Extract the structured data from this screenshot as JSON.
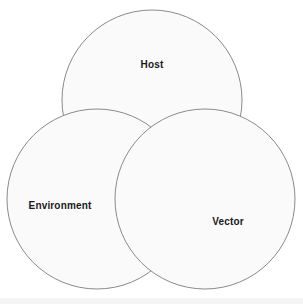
{
  "figure": {
    "type": "venn-diagram",
    "title": "",
    "width": 303,
    "height": 304,
    "background_color": "#ffffff",
    "circle_fill_color": "#fafafa",
    "circle_stroke_color": "#8a8a8a",
    "circle_stroke_width": 1,
    "label_color": "#1a1a1a",
    "bottom_strip_color": "#f4f4f4"
  },
  "chart_data": {
    "type": "venn",
    "title": "",
    "xlabel": "",
    "ylabel": "",
    "sets": [
      {
        "id": "host",
        "label": "Host",
        "cx": 152,
        "cy": 100,
        "r": 90,
        "label_x": 152,
        "label_y": 65
      },
      {
        "id": "environment",
        "label": "Environment",
        "cx": 97,
        "cy": 199,
        "r": 90,
        "label_x": 60,
        "label_y": 206
      },
      {
        "id": "vector",
        "label": "Vector",
        "cx": 205,
        "cy": 199,
        "r": 90,
        "label_x": 228,
        "label_y": 222
      }
    ],
    "overlaps": [
      "host-environment",
      "host-vector",
      "environment-vector",
      "host-environment-vector"
    ],
    "legend": "none",
    "grid": false
  }
}
